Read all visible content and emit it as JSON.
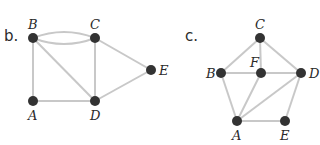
{
  "colors": {
    "edge": "#c8c8c8",
    "node": "#333333",
    "text": "#2a2a2a",
    "background": "#ffffff"
  },
  "graphs": [
    {
      "panel_label": "b.",
      "nodes": [
        {
          "id": "B",
          "x": 33,
          "y": 38
        },
        {
          "id": "C",
          "x": 95,
          "y": 38
        },
        {
          "id": "E",
          "x": 151,
          "y": 70
        },
        {
          "id": "A",
          "x": 33,
          "y": 101
        },
        {
          "id": "D",
          "x": 95,
          "y": 101
        }
      ],
      "edges": [
        [
          "B",
          "C",
          "upper-arc"
        ],
        [
          "B",
          "C",
          "lower-arc"
        ],
        [
          "B",
          "A"
        ],
        [
          "B",
          "D"
        ],
        [
          "C",
          "D"
        ],
        [
          "C",
          "E"
        ],
        [
          "A",
          "D"
        ],
        [
          "D",
          "E"
        ]
      ]
    },
    {
      "panel_label": "c.",
      "nodes": [
        {
          "id": "C",
          "x": 260,
          "y": 38
        },
        {
          "id": "B",
          "x": 221,
          "y": 73
        },
        {
          "id": "F",
          "x": 261,
          "y": 73
        },
        {
          "id": "D",
          "x": 301,
          "y": 73
        },
        {
          "id": "A",
          "x": 237,
          "y": 121
        },
        {
          "id": "E",
          "x": 285,
          "y": 121
        }
      ],
      "edges": [
        [
          "C",
          "B"
        ],
        [
          "C",
          "F"
        ],
        [
          "C",
          "D"
        ],
        [
          "B",
          "F"
        ],
        [
          "F",
          "D"
        ],
        [
          "B",
          "A"
        ],
        [
          "F",
          "A"
        ],
        [
          "D",
          "A"
        ],
        [
          "D",
          "E"
        ],
        [
          "A",
          "E"
        ]
      ]
    }
  ]
}
